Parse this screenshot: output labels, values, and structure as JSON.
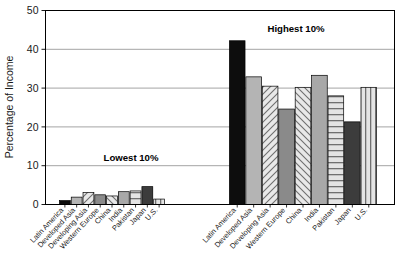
{
  "chart_data": {
    "type": "bar",
    "title": "",
    "xlabel": "",
    "ylabel": "Percentage of Income",
    "ylim": [
      0,
      50
    ],
    "yticks": [
      0,
      10,
      20,
      30,
      40,
      50
    ],
    "ytick_labels": [
      "0",
      "10",
      "20",
      "30",
      "40",
      "50"
    ],
    "grid": true,
    "legend": false,
    "legend_position": "none",
    "categories": [
      "Latin America",
      "Developed Asia",
      "Developing Asia",
      "Western Europe",
      "China",
      "India",
      "Pakistan",
      "Japan",
      "U.S."
    ],
    "groups": [
      {
        "name": "Lowest 10%",
        "annotation": "Lowest 10%",
        "values": [
          1.0,
          1.9,
          3.1,
          2.5,
          2.2,
          3.3,
          3.5,
          4.6,
          1.4
        ]
      },
      {
        "name": "Highest 10%",
        "annotation": "Highest 10%",
        "values": [
          42.2,
          32.9,
          30.5,
          24.6,
          30.2,
          33.3,
          28.0,
          21.3,
          30.2
        ]
      }
    ],
    "series_styles": [
      "black-solid",
      "light-gray-solid",
      "diagonal-hatch-up",
      "dark-gray-solid",
      "diagonal-hatch-down",
      "medium-gray-solid",
      "horizontal-stripes",
      "very-dark-gray-solid",
      "vertical-stripes"
    ],
    "colors": {
      "black": "#0d0d0d",
      "light_gray": "#b4b4b4",
      "dark_gray": "#8a8a8a",
      "medium_gray": "#a8a8a8",
      "very_dark_gray": "#3c3c3c",
      "hatch_bg": "#e6e6e6",
      "hatch_line": "#6f6f6f",
      "axis": "#000000",
      "gridline": "#9a9a9a",
      "text": "#1a1a1a"
    }
  }
}
